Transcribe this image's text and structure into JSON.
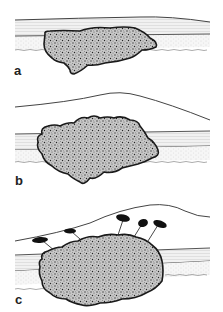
{
  "figure": {
    "panels": [
      {
        "id": "a",
        "label": "a",
        "description": "Irregular stippled mass embedded within layered tissue strata"
      },
      {
        "id": "b",
        "label": "b",
        "description": "Larger stippled mass displacing layers, with an elevated curved upper surface"
      },
      {
        "id": "c",
        "label": "c",
        "description": "Stippled mass with elevated surface and five dark markers connected by lines to the mass"
      }
    ],
    "colors": {
      "background": "#ffffff",
      "line": "#333333",
      "layer_fill": "#ececec",
      "mass_outline": "#1a1a1a",
      "mass_fill": "#b5b5b5",
      "marker": "#111111"
    }
  }
}
